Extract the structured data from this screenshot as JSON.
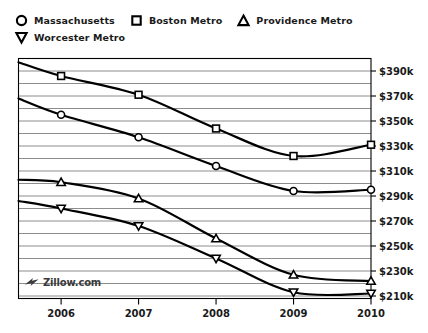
{
  "legend": {
    "items": [
      {
        "label": "Massachusetts",
        "marker": "circle-marker-icon"
      },
      {
        "label": "Boston Metro",
        "marker": "square-marker-icon"
      },
      {
        "label": "Providence Metro",
        "marker": "triangle-up-marker-icon"
      },
      {
        "label": "Worcester Metro",
        "marker": "triangle-down-marker-icon"
      }
    ]
  },
  "watermark": {
    "text": "Zillow.com",
    "icon": "zillow-logo-icon"
  },
  "colors": {
    "line": "#000000",
    "grid": "#808080",
    "axis": "#000000",
    "text": "#1a1a1a"
  },
  "chart_data": {
    "type": "line",
    "title": "",
    "xlabel": "",
    "ylabel": "",
    "xlim": [
      2005.45,
      2010.0
    ],
    "ylim": [
      208,
      400
    ],
    "grid": true,
    "grid_step": 10,
    "legend_position": "top-left",
    "x_ticks": [
      "2006",
      "2007",
      "2008",
      "2009",
      "2010"
    ],
    "x_tick_values": [
      2006,
      2007,
      2008,
      2009,
      2010
    ],
    "y_ticks": [
      "$390k",
      "$370k",
      "$350k",
      "$330k",
      "$310k",
      "$290k",
      "$270k",
      "$250k",
      "$230k",
      "$210k"
    ],
    "y_tick_values": [
      390,
      370,
      350,
      330,
      310,
      290,
      270,
      250,
      230,
      210
    ],
    "x": [
      2005.45,
      2006,
      2007,
      2008,
      2009,
      2010
    ],
    "series": [
      {
        "name": "Massachusetts",
        "marker": "circle",
        "values": [
          368,
          355,
          337,
          314,
          294,
          295
        ],
        "marker_x": [
          2006,
          2007,
          2008,
          2009,
          2010
        ],
        "marker_values": [
          355,
          337,
          314,
          294,
          295
        ]
      },
      {
        "name": "Boston Metro",
        "marker": "square",
        "values": [
          397,
          386,
          371,
          344,
          322,
          331
        ],
        "marker_x": [
          2006,
          2007,
          2008,
          2009,
          2010
        ],
        "marker_values": [
          386,
          371,
          344,
          322,
          331
        ]
      },
      {
        "name": "Providence Metro",
        "marker": "triangle-up",
        "values": [
          303,
          301,
          288,
          256,
          227,
          222
        ],
        "marker_x": [
          2006,
          2007,
          2008,
          2009,
          2010
        ],
        "marker_values": [
          301,
          288,
          256,
          227,
          222
        ]
      },
      {
        "name": "Worcester Metro",
        "marker": "triangle-down",
        "values": [
          286,
          280,
          266,
          240,
          213,
          212
        ],
        "marker_x": [
          2006,
          2007,
          2008,
          2009,
          2010
        ],
        "marker_values": [
          280,
          266,
          240,
          213,
          212
        ]
      }
    ]
  }
}
